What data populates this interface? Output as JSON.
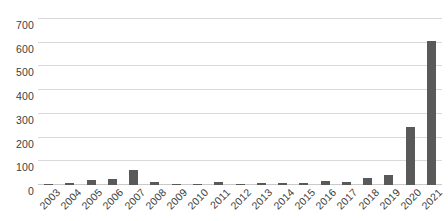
{
  "chart_data": {
    "type": "bar",
    "title": "",
    "subtitle": "",
    "xlabel": "",
    "ylabel": "",
    "categories": [
      "2003",
      "2004",
      "2005",
      "2006",
      "2007",
      "2008",
      "2009",
      "2010",
      "2011",
      "2012",
      "2013",
      "2014",
      "2015",
      "2016",
      "2017",
      "2018",
      "2019",
      "2020",
      "2021"
    ],
    "values": [
      2,
      9,
      21,
      24,
      62,
      14,
      2,
      4,
      13,
      5,
      9,
      8,
      10,
      16,
      11,
      30,
      42,
      245,
      608
    ],
    "series": [
      {
        "name": "Count",
        "values": [
          2,
          9,
          21,
          24,
          62,
          14,
          2,
          4,
          13,
          5,
          9,
          8,
          10,
          16,
          11,
          30,
          42,
          245,
          608
        ]
      }
    ],
    "ylim": [
      0,
      700
    ],
    "yticks": [
      0,
      100,
      200,
      300,
      400,
      500,
      600,
      700
    ],
    "ytick_labels": [
      "0",
      "100",
      "200",
      "300",
      "400",
      "500",
      "600",
      "700"
    ],
    "grid": true,
    "legend": false,
    "legend_position": "none",
    "bar_color": "#595959",
    "gridline_color": "#d9d9d9",
    "axis_text_color": "#3d3d3d",
    "background_color": "#ffffff",
    "xtick_rotation": -45
  }
}
